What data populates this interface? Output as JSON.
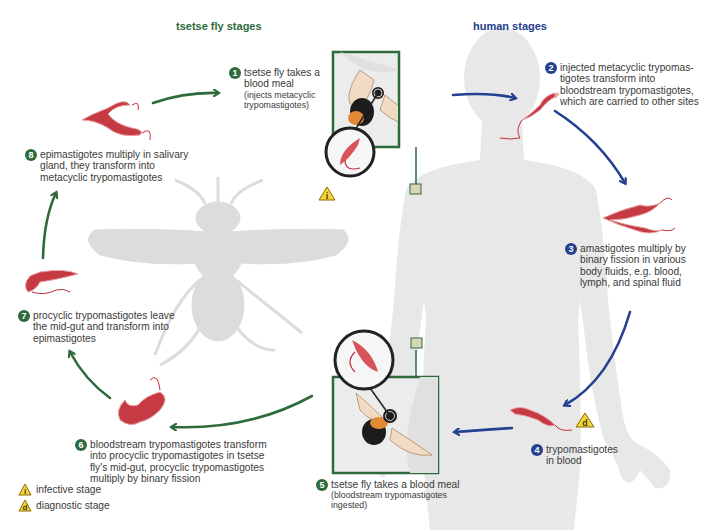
{
  "headers": {
    "fly_stages": "tsetse fly stages",
    "human_stages": "human stages"
  },
  "colors": {
    "fly_green": "#2e6a3c",
    "human_blue": "#24408f",
    "parasite_red": "#c0303a",
    "silhouette_gray": "#e6e6e6",
    "warning_yellow": "#f5d43a"
  },
  "steps": [
    {
      "num": "1",
      "text": "tsetse fly takes a blood meal",
      "sub": "(injects metacyclic trypomastigotes)",
      "side": "fly"
    },
    {
      "num": "2",
      "text": "injected metacyclic trypomas-tigotes transform into bloodstream trypomastigotes, which are carried to other sites",
      "side": "human"
    },
    {
      "num": "3",
      "text": "amastigotes multiply by binary fission in various body fluids, e.g. blood, lymph, and spinal fluid",
      "side": "human"
    },
    {
      "num": "4",
      "text": "trypomastigotes in blood",
      "side": "human"
    },
    {
      "num": "5",
      "text": "tsetse fly takes a blood meal",
      "sub": "(bloodstream trypomastigotes ingested)",
      "side": "fly"
    },
    {
      "num": "6",
      "text": "bloodstream trypomastigotes transform into procyclic trypomastigotes in tsetse fly's mid-gut, procyclic trypomastigotes multiply by binary fission",
      "side": "fly"
    },
    {
      "num": "7",
      "text": "procyclic trypomastigotes leave the mid-gut and transform into epimastigotes",
      "side": "fly"
    },
    {
      "num": "8",
      "text": "epimastigotes multiply in salivary gland, they transform into metacyclic trypomastigotes",
      "side": "fly"
    }
  ],
  "lines": {
    "s1": [
      "tsetse fly takes a",
      "blood meal"
    ],
    "s1_sub": [
      "(injects metacyclic",
      "trypomastigotes)"
    ],
    "s2": [
      "injected metacyclic trypomas-",
      "tigotes transform into",
      "bloodstream trypomastigotes,",
      "which are carried to other sites"
    ],
    "s3": [
      "amastigotes multiply by",
      "binary fission in various",
      "body fluids, e.g. blood,",
      "lymph, and spinal fluid"
    ],
    "s4": [
      "trypomastigotes",
      "in blood"
    ],
    "s5": [
      "tsetse fly takes a blood meal"
    ],
    "s5_sub": [
      "(bloodstream trypomastigotes",
      "ingested)"
    ],
    "s6": [
      "bloodstream trypomastigotes transform",
      "into procyclic trypomastigotes in tsetse",
      "fly's mid-gut, procyclic trypomastigotes",
      "multiply by binary fission"
    ],
    "s7": [
      "procyclic trypomastigotes leave",
      "the mid-gut and transform into",
      "epimastigotes"
    ],
    "s8": [
      "epimastigotes multiply in salivary",
      "gland, they transform into",
      "metacyclic trypomastigotes"
    ]
  },
  "legend": {
    "infective": {
      "glyph": "i",
      "label": "infective stage"
    },
    "diagnostic": {
      "glyph": "d",
      "label": "diagnostic stage"
    }
  },
  "icons": {
    "infective_marker": "i",
    "diagnostic_marker": "d"
  }
}
